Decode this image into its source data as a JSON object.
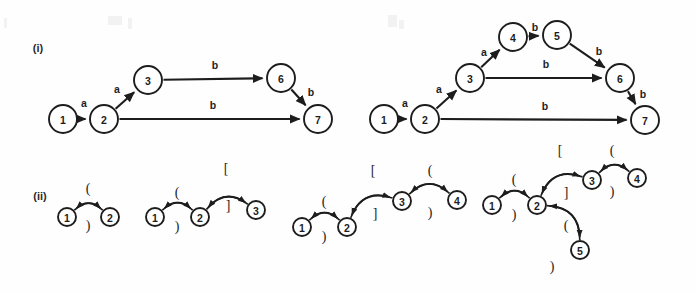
{
  "figure": {
    "background_color": "#fefefe",
    "ink_color": "#1d1d1d",
    "sections": [
      {
        "id": "i",
        "label": "(i)",
        "label_x": 38,
        "label_y": 52
      },
      {
        "id": "ii",
        "label": "(ii)",
        "label_y": 200,
        "label_x": 40
      }
    ]
  },
  "automata": [
    {
      "name": "automaton-left",
      "section": "i",
      "nodes": [
        {
          "id": "1",
          "label": "1",
          "cx": 63,
          "cy": 119,
          "r": 14
        },
        {
          "id": "2",
          "label": "2",
          "cx": 104,
          "cy": 119,
          "r": 14
        },
        {
          "id": "3",
          "label": "3",
          "cx": 148,
          "cy": 80,
          "r": 14
        },
        {
          "id": "6",
          "label": "6",
          "cx": 281,
          "cy": 78,
          "r": 14
        },
        {
          "id": "7",
          "label": "7",
          "cx": 318,
          "cy": 119,
          "r": 14
        }
      ],
      "edges": [
        {
          "from": "1",
          "to": "2",
          "label": "a",
          "label_x": 84,
          "label_y": 103
        },
        {
          "from": "2",
          "to": "3",
          "label": "a",
          "label_x": 117,
          "label_y": 89
        },
        {
          "from": "3",
          "to": "6",
          "label": "b",
          "label_x": 215,
          "label_y": 65
        },
        {
          "from": "2",
          "to": "7",
          "label": "b",
          "label_x": 213,
          "label_y": 105
        },
        {
          "from": "6",
          "to": "7",
          "label": "b",
          "label_x": 311,
          "label_y": 92
        }
      ]
    },
    {
      "name": "automaton-right",
      "section": "i",
      "nodes": [
        {
          "id": "1",
          "label": "1",
          "cx": 384,
          "cy": 119,
          "r": 14
        },
        {
          "id": "2",
          "label": "2",
          "cx": 425,
          "cy": 119,
          "r": 14
        },
        {
          "id": "3",
          "label": "3",
          "cx": 470,
          "cy": 78,
          "r": 14
        },
        {
          "id": "4",
          "label": "4",
          "cx": 513,
          "cy": 37,
          "r": 14
        },
        {
          "id": "5",
          "label": "5",
          "cx": 557,
          "cy": 35,
          "r": 14
        },
        {
          "id": "6",
          "label": "6",
          "cx": 620,
          "cy": 78,
          "r": 14
        },
        {
          "id": "7",
          "label": "7",
          "cx": 645,
          "cy": 120,
          "r": 14
        }
      ],
      "edges": [
        {
          "from": "1",
          "to": "2",
          "label": "a",
          "label_x": 405,
          "label_y": 103
        },
        {
          "from": "2",
          "to": "3",
          "label": "a",
          "label_x": 439,
          "label_y": 89
        },
        {
          "from": "3",
          "to": "4",
          "label": "a",
          "label_x": 484,
          "label_y": 52
        },
        {
          "from": "4",
          "to": "5",
          "label": "b",
          "label_x": 535,
          "label_y": 27
        },
        {
          "from": "5",
          "to": "6",
          "label": "b",
          "label_x": 599,
          "label_y": 51
        },
        {
          "from": "3",
          "to": "6",
          "label": "b",
          "label_x": 546,
          "label_y": 64
        },
        {
          "from": "2",
          "to": "7",
          "label": "b",
          "label_x": 545,
          "label_y": 106
        },
        {
          "from": "6",
          "to": "7",
          "label": "b",
          "label_x": 643,
          "label_y": 94
        }
      ]
    }
  ],
  "bracket_graphs": [
    {
      "name": "bracket-graph-1",
      "section": "ii",
      "nodes": [
        {
          "id": "1",
          "label": "1",
          "cx": 67,
          "cy": 217,
          "r": 9
        },
        {
          "id": "2",
          "label": "2",
          "cx": 110,
          "cy": 217,
          "r": 9
        }
      ],
      "arcs": [
        {
          "from": "1",
          "to": "2",
          "symbol": "(",
          "bow": "up",
          "label_x": 88,
          "label_y": 188
        },
        {
          "from": "2",
          "to": "1",
          "symbol": ")",
          "bow": "down",
          "label_x": 88,
          "label_y": 225
        }
      ]
    },
    {
      "name": "bracket-graph-2",
      "section": "ii",
      "nodes": [
        {
          "id": "1",
          "label": "1",
          "cx": 155,
          "cy": 217,
          "r": 9
        },
        {
          "id": "2",
          "label": "2",
          "cx": 200,
          "cy": 217,
          "r": 9
        },
        {
          "id": "3",
          "label": "3",
          "cx": 256,
          "cy": 210,
          "r": 9
        }
      ],
      "arcs": [
        {
          "from": "1",
          "to": "2",
          "symbol": "(",
          "bow": "up",
          "label_x": 177,
          "label_y": 192
        },
        {
          "from": "2",
          "to": "1",
          "symbol": ")",
          "bow": "down",
          "label_x": 177,
          "label_y": 226
        },
        {
          "from": "2",
          "to": "3",
          "symbol": "[",
          "bow": "up",
          "label_x": 226,
          "label_y": 168
        },
        {
          "from": "3",
          "to": "2",
          "symbol": "]",
          "bow": "down",
          "label_x": 228,
          "label_y": 205
        }
      ]
    },
    {
      "name": "bracket-graph-3",
      "section": "ii",
      "nodes": [
        {
          "id": "1",
          "label": "1",
          "cx": 302,
          "cy": 227,
          "r": 9
        },
        {
          "id": "2",
          "label": "2",
          "cx": 347,
          "cy": 227,
          "r": 9
        },
        {
          "id": "3",
          "label": "3",
          "cx": 402,
          "cy": 201,
          "r": 9
        },
        {
          "id": "4",
          "label": "4",
          "cx": 457,
          "cy": 200,
          "r": 9
        }
      ],
      "arcs": [
        {
          "from": "1",
          "to": "2",
          "symbol": "(",
          "bow": "up",
          "label_x": 324,
          "label_y": 201
        },
        {
          "from": "2",
          "to": "1",
          "symbol": ")",
          "bow": "down",
          "label_x": 324,
          "label_y": 236
        },
        {
          "from": "2",
          "to": "3",
          "symbol": "[",
          "bow": "up",
          "label_x": 373,
          "label_y": 170
        },
        {
          "from": "3",
          "to": "2",
          "symbol": "]",
          "bow": "down",
          "label_x": 375,
          "label_y": 213
        },
        {
          "from": "3",
          "to": "4",
          "symbol": "(",
          "bow": "up",
          "label_x": 430,
          "label_y": 170
        },
        {
          "from": "4",
          "to": "3",
          "symbol": ")",
          "bow": "down",
          "label_x": 430,
          "label_y": 212
        }
      ]
    },
    {
      "name": "bracket-graph-4",
      "section": "ii",
      "nodes": [
        {
          "id": "1",
          "label": "1",
          "cx": 492,
          "cy": 205,
          "r": 9
        },
        {
          "id": "2",
          "label": "2",
          "cx": 537,
          "cy": 205,
          "r": 9
        },
        {
          "id": "3",
          "label": "3",
          "cx": 592,
          "cy": 180,
          "r": 9
        },
        {
          "id": "4",
          "label": "4",
          "cx": 637,
          "cy": 178,
          "r": 9
        },
        {
          "id": "5",
          "label": "5",
          "cx": 580,
          "cy": 250,
          "r": 9
        }
      ],
      "arcs": [
        {
          "from": "1",
          "to": "2",
          "symbol": "(",
          "bow": "up",
          "label_x": 514,
          "label_y": 179
        },
        {
          "from": "2",
          "to": "1",
          "symbol": ")",
          "bow": "down",
          "label_x": 514,
          "label_y": 214
        },
        {
          "from": "2",
          "to": "3",
          "symbol": "[",
          "bow": "up",
          "label_x": 560,
          "label_y": 150
        },
        {
          "from": "3",
          "to": "2",
          "symbol": "]",
          "bow": "down",
          "label_x": 566,
          "label_y": 192
        },
        {
          "from": "3",
          "to": "4",
          "symbol": "(",
          "bow": "up",
          "label_x": 612,
          "label_y": 150
        },
        {
          "from": "4",
          "to": "3",
          "symbol": ")",
          "bow": "down",
          "label_x": 612,
          "label_y": 191
        },
        {
          "from": "2",
          "to": "5",
          "symbol": "(",
          "bow": "up",
          "label_x": 566,
          "label_y": 225
        },
        {
          "from": "5",
          "to": "2",
          "symbol": ")",
          "bow": "down",
          "label_x": 552,
          "label_y": 266
        }
      ]
    }
  ]
}
